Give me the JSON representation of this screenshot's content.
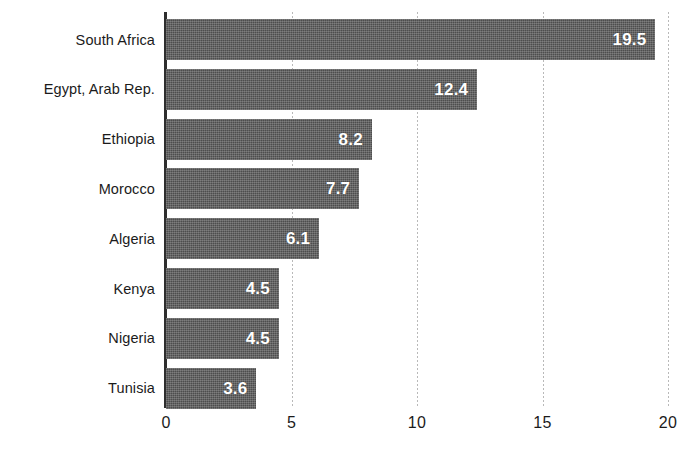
{
  "chart_data": {
    "type": "bar",
    "orientation": "horizontal",
    "title": "",
    "subtitle": "",
    "xlabel": "",
    "ylabel": "",
    "categories": [
      "South Africa",
      "Egypt, Arab Rep.",
      "Ethiopia",
      "Morocco",
      "Algeria",
      "Kenya",
      "Nigeria",
      "Tunisia"
    ],
    "values": [
      19.5,
      12.4,
      8.2,
      7.7,
      6.1,
      4.5,
      4.5,
      3.6
    ],
    "value_labels": [
      "19.5",
      "12.4",
      "8.2",
      "7.7",
      "6.1",
      "4.5",
      "4.5",
      "3.6"
    ],
    "xlim": [
      0,
      20
    ],
    "xticks": [
      0,
      5,
      10,
      15,
      20
    ],
    "xtick_labels": [
      "0",
      "5",
      "10",
      "15",
      "20"
    ],
    "grid": "vertical-dotted",
    "legend": "none",
    "bar_color": "#4d4d4d",
    "value_label_color": "#ffffff",
    "axis_color": "#2e2e2e",
    "gridline_color": "#b9b9b9",
    "background_color": "#ffffff"
  }
}
